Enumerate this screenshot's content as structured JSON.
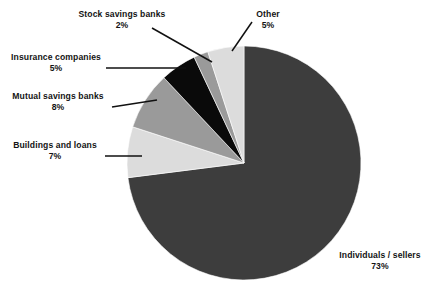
{
  "chart_data": {
    "type": "pie",
    "title": "",
    "subtitle": "",
    "xlabel": "",
    "ylabel": "",
    "legend_position": "callout-labels",
    "grid": false,
    "unit": "%",
    "start_angle_deg": 0,
    "direction": "clockwise",
    "categories": [
      "Individuals / sellers",
      "Buildings and loans",
      "Mutual savings banks",
      "Insurance companies",
      "Stock savings banks",
      "Other"
    ],
    "values": [
      73,
      7,
      8,
      5,
      2,
      5
    ],
    "slices": [
      {
        "label": "Individuals / sellers",
        "value": 73,
        "percent_text": "73%",
        "color": "#3d3d3d",
        "start_deg": 0,
        "end_deg": 262.8
      },
      {
        "label": "Buildings and loans",
        "value": 7,
        "percent_text": "7%",
        "color": "#dcdcdc",
        "start_deg": 262.8,
        "end_deg": 288.0
      },
      {
        "label": "Mutual savings banks",
        "value": 8,
        "percent_text": "8%",
        "color": "#9a9a9a",
        "start_deg": 288.0,
        "end_deg": 316.8
      },
      {
        "label": "Insurance companies",
        "value": 5,
        "percent_text": "5%",
        "color": "#0a0a0a",
        "start_deg": 316.8,
        "end_deg": 334.8
      },
      {
        "label": "Stock savings banks",
        "value": 2,
        "percent_text": "2%",
        "color": "#9a9a9a",
        "start_deg": 334.8,
        "end_deg": 342.0
      },
      {
        "label": "Other",
        "value": 5,
        "percent_text": "5%",
        "color": "#dcdcdc",
        "start_deg": 342.0,
        "end_deg": 360.0
      }
    ]
  },
  "callouts": {
    "stock_savings_banks": {
      "label": "Stock savings banks",
      "percent": "2%"
    },
    "insurance_companies": {
      "label": "Insurance companies",
      "percent": "5%"
    },
    "mutual_savings_banks": {
      "label": "Mutual savings banks",
      "percent": "8%"
    },
    "buildings_and_loans": {
      "label": "Buildings and loans",
      "percent": "7%"
    },
    "other": {
      "label": "Other",
      "percent": "5%"
    },
    "individuals_sellers": {
      "label": "Individuals / sellers",
      "percent": "73%"
    }
  },
  "geometry": {
    "center_x": 244,
    "center_y": 163,
    "radius": 117
  },
  "colors": {
    "background": "#ffffff",
    "text": "#141414",
    "leader_line": "#111111",
    "dark_gray": "#3d3d3d",
    "medium_gray": "#9a9a9a",
    "light_gray": "#dcdcdc",
    "black": "#0a0a0a"
  }
}
